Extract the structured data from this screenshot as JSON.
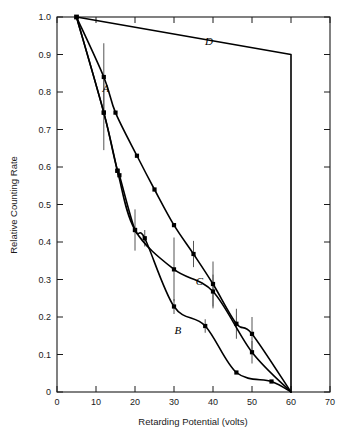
{
  "figure": {
    "background_color": "#ffffff",
    "line_color": "#000000",
    "axis_color": "#1a1a1a",
    "errorbar_color": "#555555"
  },
  "axes": {
    "x_title": "Retarding Potential (volts)",
    "y_title": "Relative Counting Rate",
    "x_ticks": [
      "0",
      "10",
      "20",
      "30",
      "40",
      "50",
      "60",
      "70"
    ],
    "y_ticks": [
      "0",
      "0.1",
      "0.2",
      "0.3",
      "0.4",
      "0.5",
      "0.6",
      "0.7",
      "0.8",
      "0.9",
      "1.0"
    ]
  },
  "curve_labels": {
    "a": "A",
    "b": "B",
    "c": "C",
    "d": "D"
  },
  "chart_data": {
    "type": "line",
    "title": "",
    "xlabel": "Retarding Potential (volts)",
    "ylabel": "Relative Counting Rate",
    "xlim": [
      0,
      70
    ],
    "ylim": [
      0,
      1.0
    ],
    "xticks": [
      0,
      10,
      20,
      30,
      40,
      50,
      60,
      70
    ],
    "yticks": [
      0,
      0.1,
      0.2,
      0.3,
      0.4,
      0.5,
      0.6,
      0.7,
      0.8,
      0.9,
      1.0
    ],
    "grid": false,
    "legend": "inline-curve-labels",
    "series": [
      {
        "name": "A",
        "label_position": [
          12.5,
          0.8
        ],
        "points": [
          {
            "x": 5.0,
            "y": 1.0
          },
          {
            "x": 12.0,
            "y": 0.84,
            "yerr": 0.09
          },
          {
            "x": 15.0,
            "y": 0.745
          },
          {
            "x": 20.5,
            "y": 0.63
          },
          {
            "x": 25.0,
            "y": 0.54
          },
          {
            "x": 30.0,
            "y": 0.445
          },
          {
            "x": 35.0,
            "y": 0.368,
            "yerr": 0.035
          },
          {
            "x": 40.0,
            "y": 0.288,
            "yerr": 0.06
          },
          {
            "x": 46.0,
            "y": 0.182,
            "yerr": 0.04
          },
          {
            "x": 50.0,
            "y": 0.155,
            "yerr": 0.045
          },
          {
            "x": 60.0,
            "y": 0.0
          }
        ]
      },
      {
        "name": "B",
        "label_position": [
          31.0,
          0.155
        ],
        "points": [
          {
            "x": 5.0,
            "y": 1.0
          },
          {
            "x": 12.0,
            "y": 0.745,
            "yerr": 0.1
          },
          {
            "x": 15.5,
            "y": 0.59
          },
          {
            "x": 16.0,
            "y": 0.578
          },
          {
            "x": 20.0,
            "y": 0.432,
            "yerr": 0.055
          },
          {
            "x": 22.5,
            "y": 0.41,
            "yerr": 0.022
          },
          {
            "x": 30.0,
            "y": 0.228,
            "yerr": 0.02
          },
          {
            "x": 38.0,
            "y": 0.176,
            "yerr": 0.018
          },
          {
            "x": 46.0,
            "y": 0.052
          },
          {
            "x": 55.0,
            "y": 0.028
          },
          {
            "x": 60.0,
            "y": 0.0
          }
        ]
      },
      {
        "name": "C",
        "label_position": [
          36.5,
          0.285
        ],
        "points": [
          {
            "x": 5.0,
            "y": 1.0
          },
          {
            "x": 12.0,
            "y": 0.745
          },
          {
            "x": 15.5,
            "y": 0.59
          },
          {
            "x": 20.0,
            "y": 0.432
          },
          {
            "x": 30.0,
            "y": 0.327,
            "yerr": 0.085
          },
          {
            "x": 40.0,
            "y": 0.268,
            "yerr": 0.045
          },
          {
            "x": 50.0,
            "y": 0.106,
            "yerr": 0.03
          },
          {
            "x": 60.0,
            "y": 0.0
          }
        ]
      },
      {
        "name": "D",
        "label_position": [
          39.0,
          0.925
        ],
        "points": [
          {
            "x": 5.0,
            "y": 1.0
          },
          {
            "x": 60.0,
            "y": 0.9
          },
          {
            "x": 60.0,
            "y": 0.0
          }
        ]
      }
    ]
  }
}
